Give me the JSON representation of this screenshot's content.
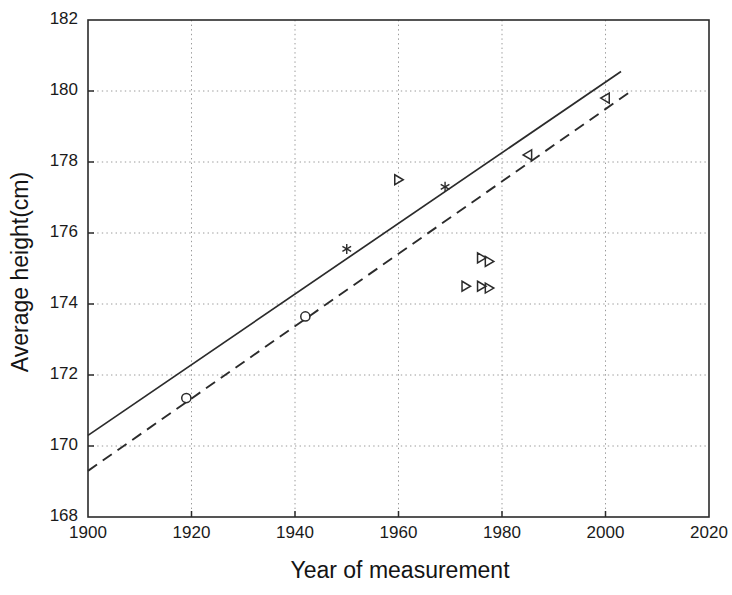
{
  "figure": {
    "background": "#ffffff",
    "ink_color": "#2b2b2b",
    "grid_color": "#9a9a9a"
  },
  "chart_data": {
    "type": "scatter",
    "title": "",
    "subtitle": "",
    "xlabel": "Year of measurement",
    "ylabel": "Average height(cm)",
    "xlim": [
      1900,
      2020
    ],
    "ylim": [
      168,
      182
    ],
    "xticks": [
      1900,
      1920,
      1940,
      1960,
      1980,
      2000,
      2020
    ],
    "xtick_labels": [
      "1900",
      "1920",
      "1940",
      "1960",
      "1980",
      "2000",
      "2020"
    ],
    "yticks": [
      168,
      170,
      172,
      174,
      176,
      178,
      180,
      182
    ],
    "ytick_labels": [
      "168",
      "170",
      "172",
      "174",
      "176",
      "178",
      "180",
      "182"
    ],
    "grid": true,
    "grid_style": "dotted",
    "legend": null,
    "legend_position": "none",
    "series": [
      {
        "name": "Upper trend line",
        "type": "line",
        "style": "solid",
        "marker": "none",
        "x": [
          1900,
          2003
        ],
        "y": [
          170.3,
          180.55
        ]
      },
      {
        "name": "Lower trend line",
        "type": "line",
        "style": "dashed",
        "marker": "none",
        "x": [
          1900,
          2005
        ],
        "y": [
          169.3,
          180.0
        ]
      },
      {
        "name": "Circle observations",
        "type": "scatter",
        "marker": "circle",
        "points": [
          {
            "x": 1919,
            "y": 171.35
          },
          {
            "x": 1942,
            "y": 173.65
          }
        ]
      },
      {
        "name": "Star observations",
        "type": "scatter",
        "marker": "star",
        "points": [
          {
            "x": 1950,
            "y": 175.55
          },
          {
            "x": 1969,
            "y": 177.3
          }
        ]
      },
      {
        "name": "Right triangle observations",
        "type": "scatter",
        "marker": "triangle-right",
        "points": [
          {
            "x": 1960,
            "y": 177.5
          },
          {
            "x": 1973,
            "y": 174.5
          },
          {
            "x": 1976,
            "y": 175.3
          },
          {
            "x": 1977.5,
            "y": 175.2
          },
          {
            "x": 1976,
            "y": 174.5
          },
          {
            "x": 1977.5,
            "y": 174.45
          }
        ]
      },
      {
        "name": "Left triangle observations",
        "type": "scatter",
        "marker": "triangle-left",
        "points": [
          {
            "x": 1985,
            "y": 178.2
          },
          {
            "x": 2000,
            "y": 179.8
          }
        ]
      }
    ]
  },
  "axes": {
    "x_title": "Year of measurement",
    "y_title": "Average height(cm)"
  }
}
